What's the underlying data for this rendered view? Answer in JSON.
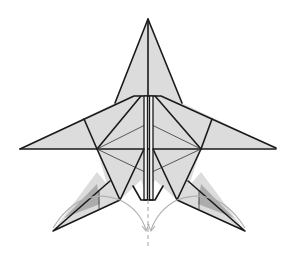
{
  "diagram": {
    "colors": {
      "paper": "#dcdcdc",
      "edges": "#1a1a1a",
      "shading": "#9c9c9c",
      "arrows": "#b0b0b0",
      "background": "#ffffff"
    },
    "icons": {
      "fold_arrows": "curved-fold-arrow",
      "center_line": "dashed-symmetry-line"
    }
  }
}
